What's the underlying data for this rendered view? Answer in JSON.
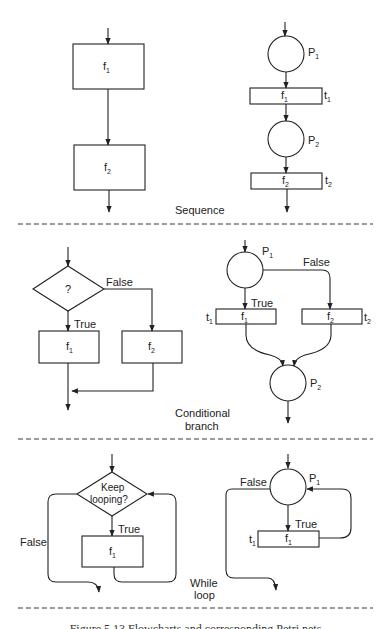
{
  "figure": {
    "caption": "Figure 5.13 Flowcharts and corresponding Petri nets",
    "sections": [
      {
        "name": "Sequence",
        "label": "Sequence",
        "flowchart": {
          "boxes": [
            "f1",
            "f2"
          ]
        },
        "petri_net": {
          "places": [
            "P1",
            "P2"
          ],
          "transitions": [
            {
              "name": "t1",
              "label": "f1"
            },
            {
              "name": "t2",
              "label": "f2"
            }
          ]
        }
      },
      {
        "name": "Conditional branch",
        "label_line1": "Conditional",
        "label_line2": "branch",
        "flowchart": {
          "decision": "?",
          "true_label": "True",
          "false_label": "False",
          "boxes": [
            "f1",
            "f2"
          ]
        },
        "petri_net": {
          "places": [
            "P1",
            "P2"
          ],
          "true_label": "True",
          "false_label": "False",
          "transitions": [
            {
              "name": "t1",
              "label": "f1"
            },
            {
              "name": "t2",
              "label": "f2"
            }
          ]
        }
      },
      {
        "name": "While loop",
        "label_line1": "While",
        "label_line2": "loop",
        "flowchart": {
          "decision_line1": "Keep",
          "decision_line2": "looping?",
          "true_label": "True",
          "false_label": "False",
          "boxes": [
            "f1"
          ]
        },
        "petri_net": {
          "places": [
            "P1"
          ],
          "true_label": "True",
          "false_label": "False",
          "transitions": [
            {
              "name": "t1",
              "label": "f1"
            }
          ]
        }
      }
    ]
  },
  "text": {
    "f": "f",
    "t": "t",
    "P": "P",
    "one": "1",
    "two": "2",
    "q": "?",
    "true": "True",
    "false": "False",
    "sequence": "Sequence",
    "conditional": "Conditional",
    "branch": "branch",
    "keep": "Keep",
    "looping": "looping?",
    "while": "While",
    "loop": "loop",
    "caption": "Figure 5.13 Flowcharts and corresponding Petri nets"
  }
}
